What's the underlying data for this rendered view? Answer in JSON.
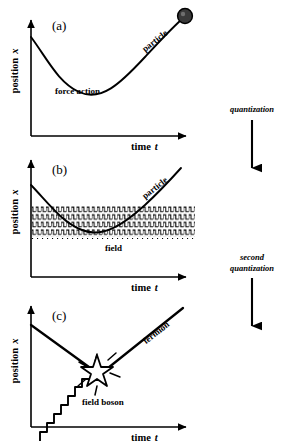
{
  "figure": {
    "ink_color": "#000000",
    "background_color": "#ffffff"
  },
  "axes": {
    "y_label": "position",
    "y_variable": "x",
    "x_label": "time",
    "x_variable": "t"
  },
  "panels": [
    {
      "id": "a",
      "tag": "(a)",
      "curve_label": "particle",
      "interior_label": "force action",
      "endpoint_marker": "filled-circle",
      "description": "Smooth curved worldline of a classical particle deflected by a force, ending in a solid ball."
    },
    {
      "id": "b",
      "tag": "(b)",
      "curve_label": "particle",
      "interior_label": "field",
      "field_rows": 6,
      "description": "Particle worldline passing through an extended oscillating field region drawn as rows of comb-like waves."
    },
    {
      "id": "c",
      "tag": "(c)",
      "curve_label": "fermion",
      "interior_label": "field boson",
      "vertex_marker": "starburst",
      "description": "Fermion worldline with a sharp vertex where a zigzag field boson line is emitted or absorbed."
    }
  ],
  "transitions": [
    {
      "id": "quantization",
      "lines": [
        "quantization"
      ],
      "arrow": "down-arrow",
      "from_panel": "a",
      "to_panel": "b"
    },
    {
      "id": "second-quantization",
      "lines": [
        "second",
        "quantization"
      ],
      "arrow": "down-arrow",
      "from_panel": "b",
      "to_panel": "c"
    }
  ]
}
